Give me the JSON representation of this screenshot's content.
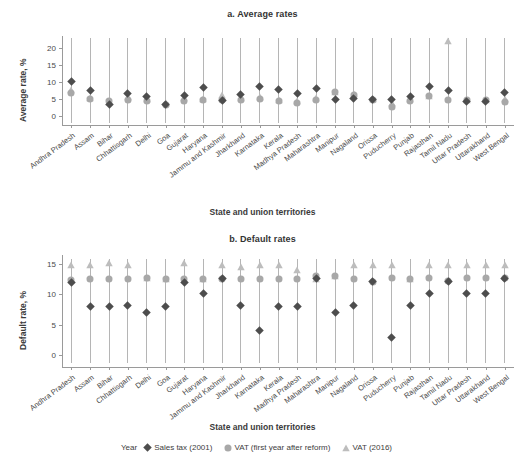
{
  "figure": {
    "legend_title": "Year",
    "series_labels": {
      "sales_tax": "Sales tax (2001)",
      "vat_first": "VAT (first year after reform)",
      "vat_2016": "VAT (2016)"
    },
    "colors": {
      "sales_tax": "#4d4d4d",
      "vat_first": "#a8a8a8",
      "vat_2016": "#bdbdbd",
      "stem": "#b5b5b5",
      "axis": "#9a9a9a",
      "text": "#3d3d3d"
    }
  },
  "chart_data": [
    {
      "type": "scatter",
      "id": "panel-a",
      "title": "a. Average rates",
      "xlabel": "State and union territories",
      "ylabel": "Average rate, %",
      "ylim": [
        -2.5,
        23.5
      ],
      "yticks": [
        0,
        5,
        10,
        15,
        20
      ],
      "grid": false,
      "legend_position": "bottom",
      "categories": [
        "Andhra Pradesh",
        "Assam",
        "Bihar",
        "Chhattisgarh",
        "Delhi",
        "Goa",
        "Gujarat",
        "Haryana",
        "Jammu and Kashmir",
        "Jharkhand",
        "Karnataka",
        "Kerala",
        "Madhya Pradesh",
        "Maharashtra",
        "Manipur",
        "Nagaland",
        "Orissa",
        "Puducherry",
        "Punjab",
        "Rajasthan",
        "Tamil Nadu",
        "Uttar Pradesh",
        "Uttarakhand",
        "West Bengal"
      ],
      "series": [
        {
          "name": "Sales tax (2001)",
          "marker": "diamond",
          "values": [
            10.1,
            7.7,
            3.6,
            6.6,
            5.7,
            3.5,
            6.2,
            8.5,
            4.8,
            6.5,
            8.8,
            7.9,
            6.7,
            8.3,
            5.0,
            5.1,
            5.0,
            4.9,
            5.7,
            8.7,
            7.6,
            4.3,
            4.4,
            6.9
          ]
        },
        {
          "name": "VAT (first year after reform)",
          "marker": "circle",
          "values": [
            6.9,
            5.0,
            4.4,
            4.9,
            4.6,
            3.4,
            4.4,
            4.7,
            4.9,
            4.7,
            5.2,
            4.4,
            3.9,
            4.9,
            7.0,
            6.4,
            4.9,
            2.9,
            4.6,
            6.0,
            4.7,
            4.8,
            4.8,
            4.3
          ]
        },
        {
          "name": "VAT (2016)",
          "marker": "triangle",
          "values": [
            7.6,
            5.4,
            4.3,
            5.6,
            5.1,
            3.9,
            5.4,
            5.2,
            6.4,
            5.3,
            5.7,
            4.9,
            4.4,
            5.3,
            7.1,
            6.5,
            5.0,
            4.0,
            5.1,
            6.1,
            22.0,
            4.9,
            4.9,
            5.0
          ]
        }
      ]
    },
    {
      "type": "scatter",
      "id": "panel-b",
      "title": "b. Default rates",
      "xlabel": "State and union territories",
      "ylabel": "Default rate, %",
      "ylim": [
        -2.0,
        16.5
      ],
      "yticks": [
        0,
        5,
        10,
        15
      ],
      "grid": false,
      "legend_position": "bottom",
      "categories": [
        "Andhra Pradesh",
        "Assam",
        "Bihar",
        "Chhattisgarh",
        "Delhi",
        "Goa",
        "Gujarat",
        "Haryana",
        "Jammu and Kashmir",
        "Jharkhand",
        "Karnataka",
        "Kerala",
        "Madhya Pradesh",
        "Maharashtra",
        "Manipur",
        "Nagaland",
        "Orissa",
        "Puducherry",
        "Punjab",
        "Rajasthan",
        "Tamil Nadu",
        "Uttar Pradesh",
        "Uttarakhand",
        "West Bengal"
      ],
      "series": [
        {
          "name": "Sales tax (2001)",
          "marker": "diamond",
          "values": [
            12.0,
            8.0,
            8.0,
            8.1,
            7.0,
            8.0,
            11.9,
            10.1,
            12.6,
            8.1,
            4.0,
            8.0,
            8.0,
            12.7,
            7.0,
            8.2,
            12.1,
            2.9,
            8.2,
            10.1,
            12.2,
            10.1,
            10.1,
            12.7
          ]
        },
        {
          "name": "VAT (first year after reform)",
          "marker": "circle",
          "values": [
            12.4,
            12.6,
            12.6,
            12.6,
            12.7,
            12.6,
            12.6,
            12.6,
            12.6,
            12.6,
            12.6,
            12.6,
            12.6,
            13.0,
            13.0,
            12.6,
            12.1,
            12.7,
            12.6,
            12.7,
            12.2,
            12.7,
            12.7,
            12.7
          ]
        },
        {
          "name": "VAT (2016)",
          "marker": "triangle",
          "values": [
            14.8,
            14.8,
            15.1,
            14.8,
            12.7,
            12.6,
            15.2,
            12.6,
            14.8,
            14.5,
            14.8,
            14.8,
            14.1,
            12.6,
            13.0,
            14.8,
            14.8,
            14.8,
            12.6,
            14.8,
            14.8,
            14.8,
            14.8,
            14.8
          ]
        }
      ]
    }
  ]
}
